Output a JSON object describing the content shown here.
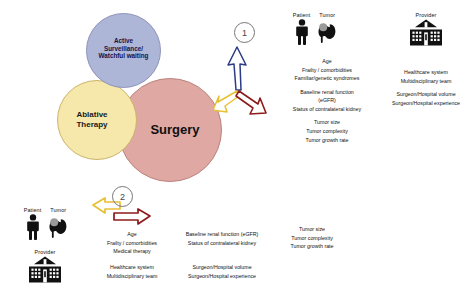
{
  "figure": {
    "circles": [
      {
        "id": "active-surveillance",
        "label": "Active\nSurveillance/\nWatchful waiting",
        "color": "#aeb6d8"
      },
      {
        "id": "ablative-therapy",
        "label": "Ablative\nTherapy",
        "color": "#f6e7ab"
      },
      {
        "id": "surgery",
        "label": "Surgery",
        "color": "#dfa8a2"
      }
    ],
    "badges": {
      "one": "1",
      "two": "2"
    },
    "arrow_colors": {
      "blue": "#2b3b86",
      "yellow": "#e8c033",
      "red": "#8e1b1b",
      "red_bright": "#b32222"
    }
  },
  "group_one": {
    "patient_header": "Patient",
    "tumor_header": "Tumor",
    "provider_header": "Provider",
    "patient_tumor_factors": {
      "block_a": [
        "Age",
        "Frailty / comorbidities",
        "Familiar/genetic syndromes"
      ],
      "block_b": [
        "Baseline renal function",
        "(eGFR)",
        "Status of contralateral kidney"
      ],
      "block_c": [
        "Tumor size",
        "Tumor complexity",
        "Tumor growth rate"
      ]
    },
    "provider_factors": {
      "block_a": [
        "Healthcare system",
        "Multidisciplinary team"
      ],
      "block_b": [
        "Surgeon/Hospital volume",
        "Surgeon/Hospital experience"
      ]
    }
  },
  "group_two": {
    "patient_header": "Patient",
    "tumor_header": "Tumor",
    "provider_header": "Provider",
    "column_one": [
      "Age",
      "Frailty / comorbidities",
      "Medical therapy"
    ],
    "column_two": [
      "Baseline renal function (eGFR)",
      "Status of contralateral kidney"
    ],
    "column_three": [
      "Tumor size",
      "Tumor complexity",
      "Tumor growth rate"
    ],
    "column_four": [
      "Healthcare system",
      "Multidisciplinary team"
    ],
    "column_five": [
      "Surgeon/Hospital volume",
      "Surgeon/Hospital experience"
    ]
  },
  "icons": {
    "patient": "person-icon",
    "tumor": "kidney-tumor-icon",
    "provider": "hospital-building-icon"
  }
}
